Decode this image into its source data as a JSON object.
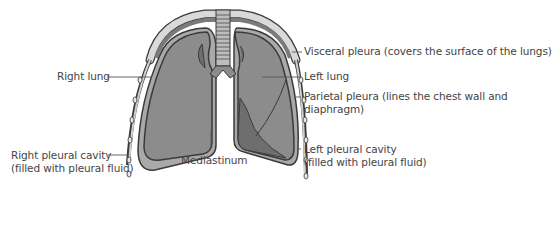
{
  "diagram": {
    "colors": {
      "lung_fill": "#8c8c8c",
      "lung_dark": "#6e6e6e",
      "outline": "#3a3a3a",
      "cavity_fill": "#a9a9a9",
      "bone": "#d9d9d9",
      "rib_dark": "#7a7a7a",
      "label_text": "#444444",
      "leader_line": "#555555"
    },
    "labels": {
      "right_lung": "Right lung",
      "right_pleural_cavity_line1": "Right pleural cavity",
      "right_pleural_cavity_line2": "(filled with pleural fluid)",
      "mediastinum": "Mediastinum",
      "visceral_pleura": "Visceral pleura (covers the surface of the lungs)",
      "left_lung": "Left lung",
      "parietal_pleura_line1": "Parietal pleura (lines the chest wall and",
      "parietal_pleura_line2": "diaphragm)",
      "left_pleural_cavity_line1": "Left pleural cavity",
      "left_pleural_cavity_line2": "(filled with pleural fluid)"
    }
  }
}
